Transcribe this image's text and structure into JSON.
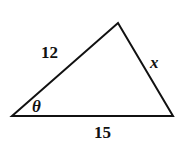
{
  "diagram": {
    "type": "triangle",
    "vertices": {
      "left": [
        12,
        116
      ],
      "top": [
        118,
        23
      ],
      "right": [
        173,
        116
      ]
    },
    "sides": {
      "left_side": {
        "label": "12"
      },
      "right_side": {
        "label": "x"
      },
      "base": {
        "label": "15"
      }
    },
    "angle": {
      "label": "θ",
      "vertex": "left"
    },
    "stroke_color": "#111111"
  }
}
